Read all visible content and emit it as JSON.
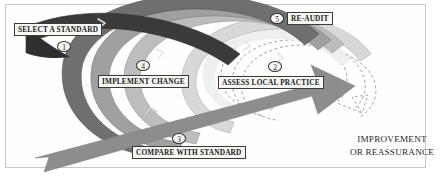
{
  "figure": {
    "background_color": "#ffffff",
    "frame_color": "#c9c9c4"
  },
  "stages": [
    {
      "number": "1",
      "label": "SELECT A STANDARD",
      "band_color": "#3b3b3b",
      "band_tone": "dark"
    },
    {
      "number": "2",
      "label": "ASSESS LOCAL PRACTICE",
      "band_color": "#6e6e6e",
      "band_tone": "mid-dark"
    },
    {
      "number": "3",
      "label": "COMPARE WITH STANDARD",
      "band_color": "#9a9a9a",
      "band_tone": "mid"
    },
    {
      "number": "4",
      "label": "IMPLEMENT CHANGE",
      "band_color": "#b8b8b8",
      "band_tone": "light"
    },
    {
      "number": "5",
      "label": "RE-AUDIT",
      "band_color": "#d6d6d6",
      "band_tone": "lightest"
    }
  ],
  "outcome_arrow": {
    "line1": "IMPROVEMENT",
    "line2": "OR REASSURANCE",
    "color": "#8d8d8d"
  },
  "icons": {
    "spiral": "spiral-band-icon",
    "dashed_spiral": "dashed-spiral-icon",
    "arrow": "improvement-arrow-icon",
    "chevron": "chevron-marker-icon"
  }
}
